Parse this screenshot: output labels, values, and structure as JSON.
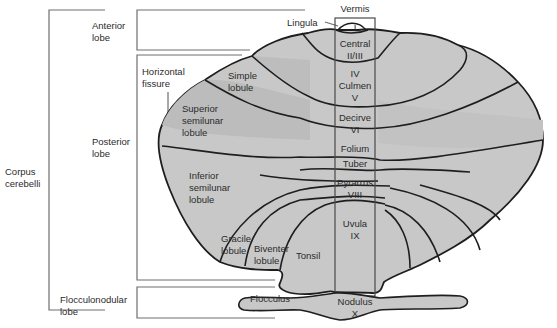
{
  "diagram": {
    "title_vermis": "Vermis",
    "brackets": {
      "corpus": [
        "Corpus",
        "cerebelli"
      ],
      "anterior": [
        "Anterior",
        "lobe"
      ],
      "posterior": [
        "Posterior",
        "lobe"
      ],
      "flocculonodular": [
        "Flocculonodular",
        "lobe"
      ]
    },
    "hemisphere_labels": {
      "horizontal_fissure": [
        "Horizontal",
        "fissure"
      ],
      "simple_lobule": [
        "Simple",
        "lobule"
      ],
      "superior_semilunar": [
        "Superior",
        "semilunar",
        "lobule"
      ],
      "inferior_semilunar": [
        "Inferior",
        "semilunar",
        "lobule"
      ],
      "gracile": [
        "Gracile",
        "lobule"
      ],
      "biventer": [
        "Biventer",
        "lobule"
      ],
      "tonsil": "Tonsil",
      "flocculus": "Flocculus"
    },
    "vermis_labels": {
      "lingula_pointer": "Lingula",
      "lingula": "I",
      "central": [
        "Central",
        "II/III"
      ],
      "culmen": [
        "IV",
        "Culmen",
        "V"
      ],
      "declive": [
        "Decirve",
        "VI"
      ],
      "folium": "Folium",
      "tuber": "Tuber",
      "pyramis": [
        "Pyrarrus",
        "VIII"
      ],
      "uvula": [
        "Uvula",
        "IX"
      ],
      "nodulus": [
        "Nodulus",
        "X"
      ]
    },
    "colors": {
      "fill": "#c8c8c8",
      "fill_dark": "#b4b4b4",
      "outline": "#1e1e1e",
      "bracket": "#6e6e6e",
      "text": "#2b2b2b"
    }
  }
}
